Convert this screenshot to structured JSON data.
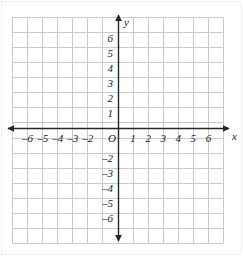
{
  "figure": {
    "kind": "cartesian-coordinate-grid",
    "background_color": "#ffffff",
    "grid_color": "#c9c9c9",
    "axis_color": "#262626",
    "label_color": "#1a1a1a",
    "outer_border_color": "#efefef"
  },
  "geometry": {
    "origin_x": 118,
    "origin_y": 128,
    "cell_px": 15.07,
    "grid_left": 12,
    "grid_right": 223,
    "grid_top": 17,
    "grid_bottom": 243,
    "x_cells": 14,
    "y_cells": 15
  },
  "axes": {
    "x": {
      "name": "x",
      "name_x": 232,
      "name_y": 131,
      "arrow_left_tip": 8,
      "arrow_right_tip": 229,
      "range": [
        -7,
        7
      ],
      "tick_values": [
        -6,
        -5,
        -4,
        -3,
        -2,
        1,
        2,
        3,
        4,
        5,
        6
      ],
      "tick_labels": [
        "–6",
        "–5",
        "–4",
        "–3",
        "–2",
        "1",
        "2",
        "3",
        "4",
        "5",
        "6"
      ],
      "label_y": 133
    },
    "y": {
      "name": "y",
      "name_x": 124,
      "name_y": 17,
      "arrow_top_tip": 15,
      "arrow_bottom_tip": 241,
      "range": [
        -7,
        7
      ],
      "tick_values": [
        6,
        5,
        4,
        3,
        2,
        1,
        -2,
        -3,
        -4,
        -5,
        -6
      ],
      "tick_labels": [
        "6",
        "5",
        "4",
        "3",
        "2",
        "1",
        "–2",
        "–3",
        "–4",
        "–5",
        "–6"
      ],
      "label_x": 109
    },
    "origin": {
      "label": "O",
      "x": 108,
      "y": 133
    }
  }
}
